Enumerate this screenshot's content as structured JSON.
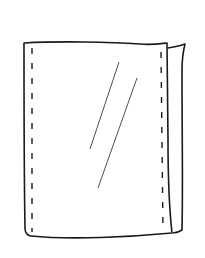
{
  "image": {
    "subject": "plastic-sleeve-sketch",
    "description": "Hand-drawn line illustration of a clear plastic bag/sleeve with stitched (dashed) side seams, a folded right edge, and two diagonal gloss lines",
    "colors": {
      "background": "#ffffff",
      "stroke": "#1a1a1a",
      "gloss": "#3a3a3a"
    }
  }
}
